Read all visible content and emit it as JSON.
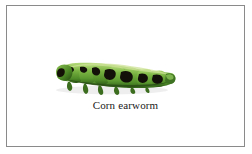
{
  "figure": {
    "caption": "Corn earworm",
    "frame_border_color": "#8a8a8a",
    "background_color": "#ffffff",
    "caption_color": "#1a1a1a"
  },
  "specimen": {
    "name": "Corn earworm",
    "type": "caterpillar",
    "orientation": "head-left",
    "colors": {
      "body_green_light": "#9ccb5e",
      "body_green_mid": "#6aa83c",
      "body_green_dark": "#3f7323",
      "marking_dark": "#121008",
      "highlight": "#cfe39a",
      "shadow": "#2a4d16",
      "proleg": "#4d7a28"
    },
    "segment_count": 11
  }
}
